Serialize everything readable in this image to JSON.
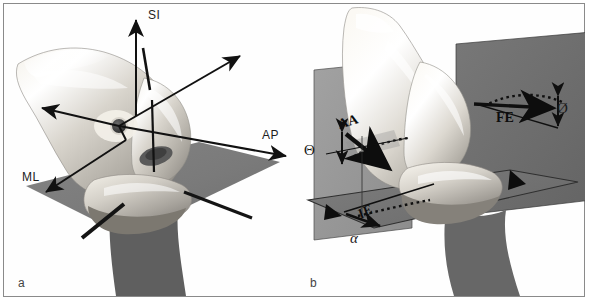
{
  "figure": {
    "caption_labels": {
      "panel_a": "a",
      "panel_b": "b"
    },
    "border_color": "#8a8a8a",
    "background_color": "#ffffff"
  },
  "panel_a": {
    "description": "Three-dimensional grayscale rendering of a knee joint (femur and tibia) with an oblique shaded reference plane and three orthogonal translation axes drawn as double-headed arrows through a marked joint centre.",
    "axes": [
      {
        "name": "SI",
        "label": "SI",
        "meaning": "superior-inferior",
        "direction": "vertical-up"
      },
      {
        "name": "AP",
        "label": "AP",
        "meaning": "anterior-posterior",
        "direction": "horizontal-right"
      },
      {
        "name": "ML",
        "label": "ML",
        "meaning": "medio-lateral",
        "direction": "diagonal-down-left"
      }
    ],
    "origin_marker": {
      "name": "joint-centre-marker",
      "color": "#3c3c3c"
    },
    "plane": {
      "name": "reference-plane",
      "color": "#7c7c7c"
    },
    "rods": {
      "count": 3,
      "color": "#141414"
    }
  },
  "panel_b": {
    "description": "Knee joint rendering intersected by three anatomical planes (sagittal, coronal, transverse) with curved dotted arrows indicating the three rotational degrees of freedom and their angle symbols.",
    "rotations": [
      {
        "name": "FE",
        "label": "FE",
        "meaning": "flexion-extension",
        "angle_symbol": "Ø"
      },
      {
        "name": "AA",
        "label": "AA",
        "meaning": "abduction-adduction",
        "angle_symbol": "Θ"
      },
      {
        "name": "IE",
        "label": "IE",
        "meaning": "internal-external rotation",
        "angle_symbol": "α"
      }
    ],
    "angle_symbols": {
      "phi": "Ø",
      "theta": "Θ",
      "alpha": "α"
    },
    "planes": [
      {
        "name": "sagittal-plane",
        "color": "#9a9a9a"
      },
      {
        "name": "coronal-plane",
        "color": "#6f6f6f"
      },
      {
        "name": "transverse-plane",
        "color": "#767676"
      }
    ]
  }
}
